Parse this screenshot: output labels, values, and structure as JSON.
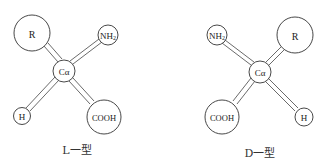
{
  "diagram": {
    "left": {
      "caption": "L一型",
      "center": "Cα",
      "groups": {
        "top_left": "R",
        "top_right": "NH2",
        "bottom_left": "H",
        "bottom_right": "COOH"
      }
    },
    "right": {
      "caption": "D一型",
      "center": "Cα",
      "groups": {
        "top_left": "NH2",
        "top_right": "R",
        "bottom_left": "COOH",
        "bottom_right": "H"
      }
    }
  }
}
